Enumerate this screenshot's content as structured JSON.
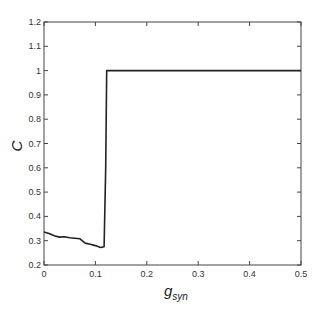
{
  "chart_data": {
    "type": "line",
    "title": "",
    "xlabel": "g",
    "xlabel_subscript": "syn",
    "ylabel": "C",
    "xlim": [
      0,
      0.5
    ],
    "ylim": [
      0.2,
      1.2
    ],
    "xticks": [
      0,
      0.1,
      0.2,
      0.3,
      0.4,
      0.5
    ],
    "xtick_labels": [
      "0",
      "0.1",
      "0.2",
      "0.3",
      "0.4",
      "0.5"
    ],
    "yticks": [
      0.2,
      0.3,
      0.4,
      0.5,
      0.6,
      0.7,
      0.8,
      0.9,
      1.0,
      1.1,
      1.2
    ],
    "ytick_labels": [
      "0.2",
      "0.3",
      "0.4",
      "0.5",
      "0.6",
      "0.7",
      "0.8",
      "0.9",
      "1",
      "1.1",
      "1.2"
    ],
    "grid": false,
    "legend": null,
    "series": [
      {
        "name": "C",
        "color": "#222222",
        "x": [
          0,
          0.01,
          0.02,
          0.03,
          0.04,
          0.05,
          0.06,
          0.07,
          0.08,
          0.09,
          0.1,
          0.11,
          0.117,
          0.12,
          0.122,
          0.15,
          0.2,
          0.3,
          0.4,
          0.5
        ],
        "y": [
          0.336,
          0.33,
          0.32,
          0.315,
          0.316,
          0.312,
          0.31,
          0.308,
          0.29,
          0.285,
          0.28,
          0.272,
          0.275,
          0.6,
          1.0,
          1.0,
          1.0,
          1.0,
          1.0,
          1.0
        ]
      }
    ]
  }
}
